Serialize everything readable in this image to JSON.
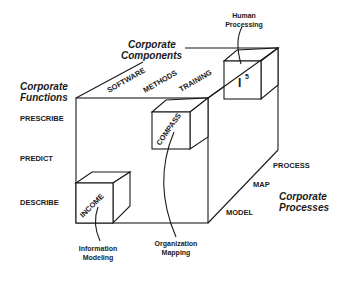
{
  "diagram": {
    "type": "3d-cube-framework",
    "axes": {
      "functions": {
        "title_line1": "Corporate",
        "title_line2": "Functions",
        "labels": [
          "PRESCRIBE",
          "PREDICT",
          "DESCRIBE"
        ]
      },
      "components": {
        "title_line1": "Corporate",
        "title_line2": "Components",
        "labels": [
          "SOFTWARE",
          "METHODS",
          "TRAINING"
        ]
      },
      "processes": {
        "title_line1": "Corporate",
        "title_line2": "Processes",
        "labels": [
          "PROCESS",
          "MAP",
          "MODEL"
        ]
      }
    },
    "subcubes": [
      {
        "id": "income",
        "label": "INCOME",
        "callout_line1": "Information",
        "callout_line2": "Modeling"
      },
      {
        "id": "compass",
        "label": "COMPASS",
        "callout_line1": "Organization",
        "callout_line2": "Mapping"
      },
      {
        "id": "i5",
        "label": "I",
        "superscript": "5",
        "callout_line1": "Human",
        "callout_line2": "Processing"
      }
    ],
    "colors": {
      "line": "#1a1a1a",
      "background": "#ffffff"
    }
  }
}
